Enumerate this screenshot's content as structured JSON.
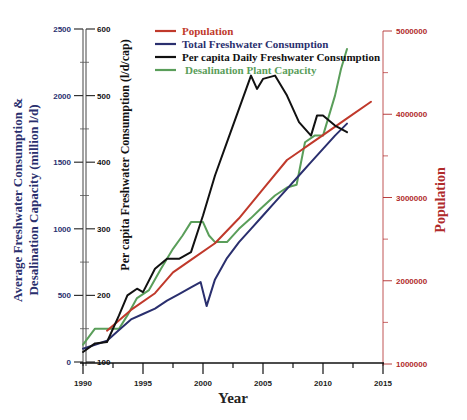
{
  "chart_data": {
    "type": "line",
    "title": "",
    "xlabel": "Year",
    "x_ticks": [
      "1990",
      "1995",
      "2000",
      "2005",
      "2010",
      "2015"
    ],
    "xlim": [
      1990,
      2015
    ],
    "axes": {
      "left": {
        "label_line1": "Average Freshwater Consumption &",
        "label_line2": "Desalination Capacity (million l/d)",
        "ticks": [
          "0",
          "500",
          "1000",
          "1500",
          "2000",
          "2500"
        ],
        "ylim": [
          0,
          2500
        ],
        "color": "#2a2f6e"
      },
      "per_capita": {
        "label": "Per capita Freshwater Consumption (l/d/cap)",
        "ticks": [
          "100",
          "200",
          "300",
          "400",
          "500",
          "600"
        ],
        "ylim": [
          100,
          600
        ],
        "color": "#111111"
      },
      "right": {
        "label": "Population",
        "ticks": [
          "1000000",
          "2000000",
          "3000000",
          "4000000",
          "5000000"
        ],
        "ylim": [
          1000000,
          5000000
        ],
        "color": "#b02a2a"
      }
    },
    "legend": [
      {
        "name": "Population",
        "color": "#c0392b"
      },
      {
        "name": "Total Freshwater Consumption",
        "color": "#2a2f6e"
      },
      {
        "name": "Per capita Daily Freshwater Consumption",
        "color": "#111111"
      },
      {
        "name": "Desalination Plant Capacity",
        "color": "#5a9e5a"
      }
    ],
    "series": [
      {
        "name": "Population",
        "axis": "right",
        "color": "#c0392b",
        "x": [
          1992,
          1994,
          1996,
          1997.5,
          1999,
          2001,
          2003,
          2005,
          2007,
          2008,
          2009,
          2010,
          2012,
          2014
        ],
        "values": [
          1400000,
          1650000,
          1850000,
          2100000,
          2250000,
          2450000,
          2750000,
          3100000,
          3450000,
          3550000,
          3650000,
          3750000,
          3950000,
          4150000
        ]
      },
      {
        "name": "Total Freshwater Consumption",
        "axis": "left",
        "color": "#2a2f6e",
        "x": [
          1990,
          1991,
          1992,
          1993,
          1994,
          1995,
          1996,
          1997,
          1998,
          1999,
          1999.8,
          2000.3,
          2001,
          2002,
          2003,
          2004,
          2005,
          2006,
          2007,
          2008,
          2009,
          2010,
          2011,
          2012
        ],
        "values": [
          100,
          130,
          160,
          240,
          320,
          360,
          400,
          460,
          510,
          560,
          600,
          420,
          620,
          780,
          900,
          1000,
          1100,
          1200,
          1300,
          1400,
          1500,
          1600,
          1700,
          1790
        ]
      },
      {
        "name": "Per capita Daily Freshwater Consumption",
        "axis": "per_capita",
        "color": "#111111",
        "x": [
          1990,
          1991,
          1992,
          1993,
          1993.7,
          1994.5,
          1995,
          1996,
          1997,
          1998,
          1999,
          2000,
          2001,
          2002,
          2003,
          2004,
          2004.5,
          2005,
          2006,
          2007,
          2008,
          2009,
          2009.5,
          2010,
          2011,
          2012
        ],
        "values": [
          115,
          128,
          130,
          170,
          200,
          210,
          205,
          240,
          255,
          255,
          265,
          320,
          380,
          430,
          480,
          530,
          510,
          525,
          530,
          500,
          460,
          440,
          470,
          470,
          455,
          445
        ]
      },
      {
        "name": "Desalination Plant Capacity",
        "axis": "left",
        "color": "#5a9e5a",
        "x": [
          1990,
          1991,
          1991.8,
          1993,
          1993.7,
          1994.5,
          1995.5,
          1996.5,
          1997.5,
          1998.3,
          1999,
          2000,
          2000.5,
          2001,
          2002,
          2003,
          2004,
          2004.8,
          2006,
          2007,
          2007.8,
          2008.5,
          2009.3,
          2010,
          2011,
          2011.5,
          2012
        ],
        "values": [
          130,
          250,
          250,
          250,
          350,
          480,
          540,
          700,
          850,
          950,
          1050,
          1050,
          950,
          900,
          900,
          1000,
          1080,
          1150,
          1250,
          1310,
          1330,
          1650,
          1700,
          1700,
          2000,
          2200,
          2350
        ]
      }
    ],
    "grid": false,
    "legend_position": "top-center"
  }
}
